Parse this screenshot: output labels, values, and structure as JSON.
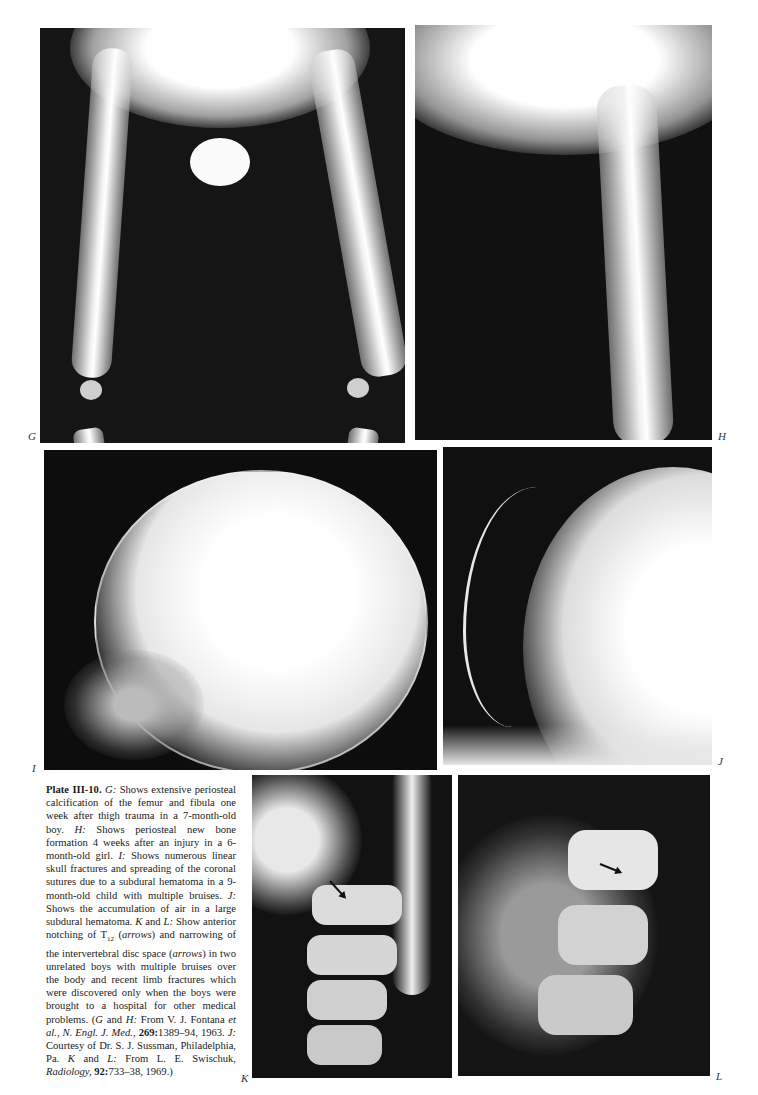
{
  "plate": {
    "title": "Plate III-10.",
    "panels": [
      {
        "id": "G",
        "label": "G",
        "description": "X-ray of infant legs: periosteal calcification of femur and fibula"
      },
      {
        "id": "H",
        "label": "H",
        "description": "X-ray of infant leg: periosteal new bone formation"
      },
      {
        "id": "I",
        "label": "I",
        "description": "Lateral skull X-ray with linear fractures"
      },
      {
        "id": "J",
        "label": "J",
        "description": "Lateral skull X-ray with air in subdural hematoma"
      },
      {
        "id": "K",
        "label": "K",
        "description": "Spine X-ray with arrow at T12 notching"
      },
      {
        "id": "L",
        "label": "L",
        "description": "Spine X-ray with arrow at T12 notching"
      }
    ]
  },
  "caption": {
    "title": "Plate III-10.",
    "segments": [
      {
        "t": "i",
        "v": "G:"
      },
      {
        "t": "n",
        "v": " Shows extensive periosteal calcification of the femur and fibula one week after thigh trauma in a 7-month-old boy. "
      },
      {
        "t": "i",
        "v": "H:"
      },
      {
        "t": "n",
        "v": " Shows periosteal new bone formation 4 weeks after an injury in a 6-month-old girl. "
      },
      {
        "t": "i",
        "v": "I:"
      },
      {
        "t": "n",
        "v": " Shows numerous linear skull fractures and spreading of the coronal sutures due to a subdural hematoma in a 9-month-old child with multiple bruises. "
      },
      {
        "t": "i",
        "v": "J:"
      },
      {
        "t": "n",
        "v": " Shows the accumulation of air in a large subdural hematoma. "
      },
      {
        "t": "i",
        "v": "K"
      },
      {
        "t": "n",
        "v": " and "
      },
      {
        "t": "i",
        "v": "L:"
      },
      {
        "t": "n",
        "v": " Show anterior notching of T"
      },
      {
        "t": "sub",
        "v": "12"
      },
      {
        "t": "n",
        "v": " ("
      },
      {
        "t": "i",
        "v": "arrows"
      },
      {
        "t": "n",
        "v": ") and narrowing of the intervertebral disc space ("
      },
      {
        "t": "i",
        "v": "arrows"
      },
      {
        "t": "n",
        "v": ") in two unrelated boys with multiple bruises over the body and recent limb fractures which were discovered only when the boys were brought to a hospital for other medical problems. ("
      },
      {
        "t": "i",
        "v": "G"
      },
      {
        "t": "n",
        "v": " and "
      },
      {
        "t": "i",
        "v": "H:"
      },
      {
        "t": "n",
        "v": " From V. J. Fontana "
      },
      {
        "t": "i",
        "v": "et al., N. Engl. J. Med.,"
      },
      {
        "t": "n",
        "v": " "
      },
      {
        "t": "b",
        "v": "269:"
      },
      {
        "t": "n",
        "v": "1389–94, 1963. "
      },
      {
        "t": "i",
        "v": "J:"
      },
      {
        "t": "n",
        "v": " Courtesy of Dr. S. J. Sussman, Philadelphia, Pa. "
      },
      {
        "t": "i",
        "v": "K"
      },
      {
        "t": "n",
        "v": " and "
      },
      {
        "t": "i",
        "v": "L:"
      },
      {
        "t": "n",
        "v": " From L. E. Swischuk, "
      },
      {
        "t": "i",
        "v": "Radiology,"
      },
      {
        "t": "n",
        "v": " "
      },
      {
        "t": "b",
        "v": "92:"
      },
      {
        "t": "n",
        "v": "733–38, 1969.)"
      }
    ]
  }
}
